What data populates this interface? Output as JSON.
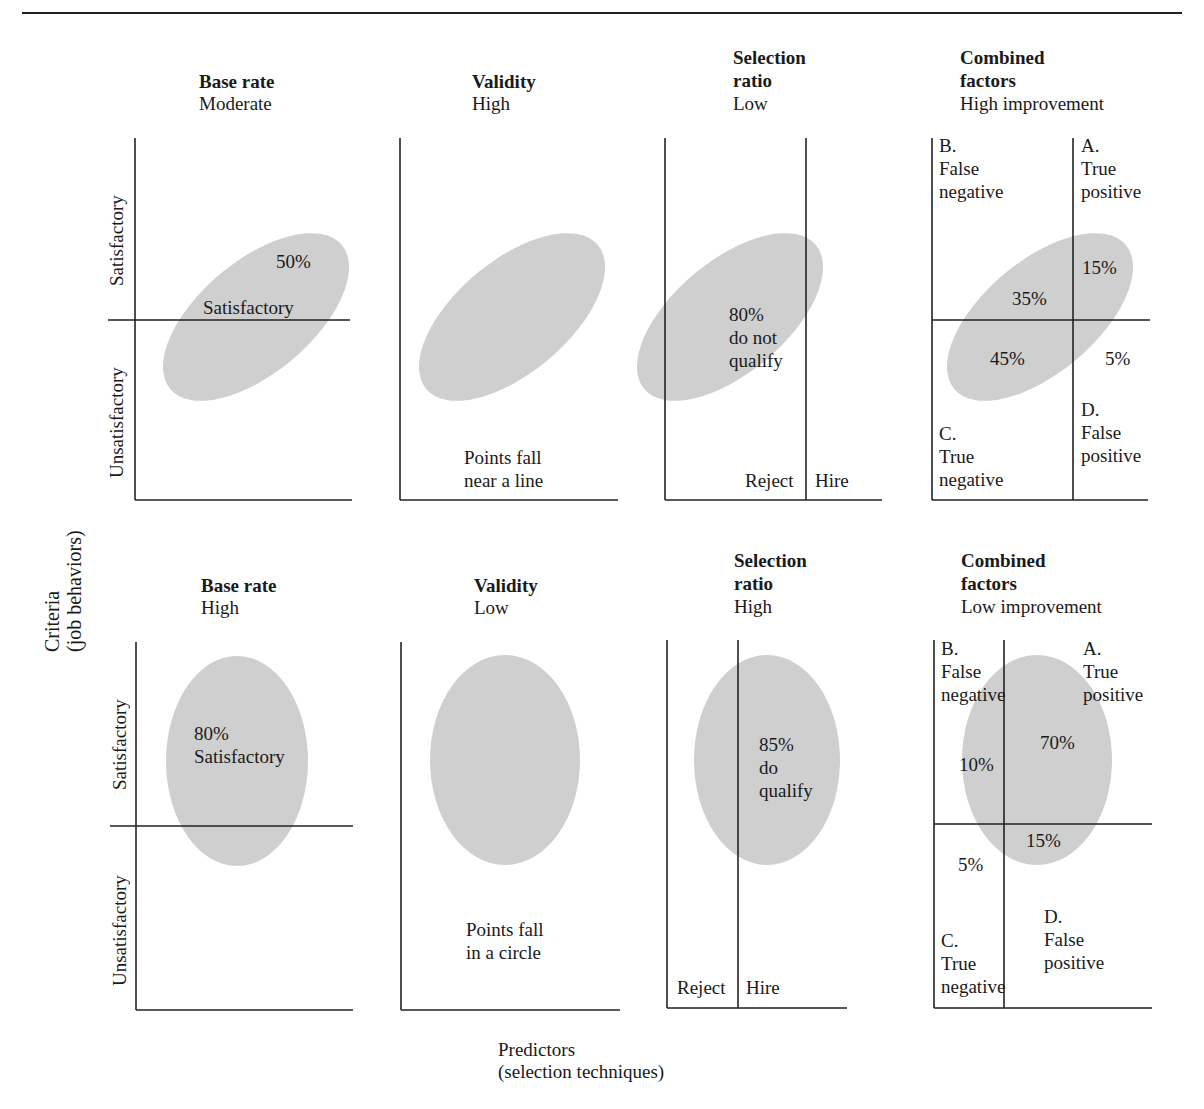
{
  "axis_labels": {
    "y_axis": [
      "Criteria",
      "(job behaviors)"
    ],
    "x_axis": [
      "Predictors",
      "(selection techniques)"
    ],
    "row_satisfactory": "Satisfactory",
    "row_unsatisfactory": "Unsatisfactory"
  },
  "colors": {
    "ellipse_fill": "#cfcfcf",
    "line": "#222222",
    "text": "#1a1a1a"
  },
  "panels": {
    "r1p1": {
      "title": "Base rate",
      "subtitle": "Moderate",
      "labels": {
        "pct": "50%",
        "desc": "Satisfactory"
      }
    },
    "r1p2": {
      "title": "Validity",
      "subtitle": "High",
      "labels": {
        "note1": "Points fall",
        "note2": "near a line"
      }
    },
    "r1p3": {
      "title1": "Selection",
      "title2": "ratio",
      "subtitle": "Low",
      "labels": {
        "pct": "80%",
        "l1": "do not",
        "l2": "qualify",
        "reject": "Reject",
        "hire": "Hire"
      }
    },
    "r1p4": {
      "title1": "Combined",
      "title2": "factors",
      "subtitle": "High improvement",
      "quadrants": {
        "A": {
          "letter": "A.",
          "l1": "True",
          "l2": "positive",
          "pct": "15%"
        },
        "B": {
          "letter": "B.",
          "l1": "False",
          "l2": "negative",
          "pct": "35%"
        },
        "C": {
          "letter": "C.",
          "l1": "True",
          "l2": "negative",
          "pct": "45%"
        },
        "D": {
          "letter": "D.",
          "l1": "False",
          "l2": "positive",
          "pct": "5%"
        }
      }
    },
    "r2p1": {
      "title": "Base rate",
      "subtitle": "High",
      "labels": {
        "pct": "80%",
        "desc": "Satisfactory"
      }
    },
    "r2p2": {
      "title": "Validity",
      "subtitle": "Low",
      "labels": {
        "note1": "Points fall",
        "note2": "in a circle"
      }
    },
    "r2p3": {
      "title1": "Selection",
      "title2": "ratio",
      "subtitle": "High",
      "labels": {
        "pct": "85%",
        "l1": "do",
        "l2": "qualify",
        "reject": "Reject",
        "hire": "Hire"
      }
    },
    "r2p4": {
      "title1": "Combined",
      "title2": "factors",
      "subtitle": "Low improvement",
      "quadrants": {
        "A": {
          "letter": "A.",
          "l1": "True",
          "l2": "positive",
          "pct": "70%"
        },
        "B": {
          "letter": "B.",
          "l1": "False",
          "l2": "negative",
          "pct": "10%"
        },
        "C": {
          "letter": "C.",
          "l1": "True",
          "l2": "negative",
          "pct": "5%"
        },
        "D": {
          "letter": "D.",
          "l1": "False",
          "l2": "positive",
          "pct": "15%"
        }
      }
    }
  }
}
